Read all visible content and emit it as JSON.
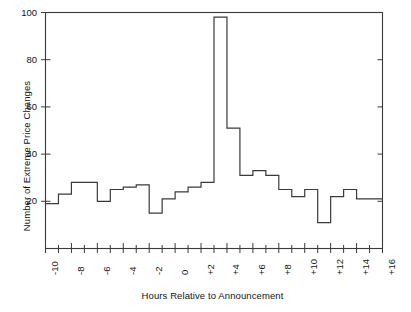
{
  "chart_data": {
    "type": "bar",
    "title": "",
    "xlabel": "Hours Relative to Announcement",
    "ylabel": "Number of Extreme Price Changes",
    "xlim": [
      -10,
      16
    ],
    "ylim": [
      0,
      100
    ],
    "grid": false,
    "legend": "none",
    "ytick_labels": [
      "100",
      "80",
      "60",
      "40",
      "20"
    ],
    "ytick_values": [
      100,
      80,
      60,
      40,
      20
    ],
    "xtick_labels": [
      "-10",
      "-8",
      "-6",
      "-4",
      "-2",
      "0",
      "+2",
      "+4",
      "+6",
      "+8",
      "+10",
      "+12",
      "+14",
      "+16"
    ],
    "xtick_values": [
      -10,
      -8,
      -6,
      -4,
      -2,
      0,
      2,
      4,
      6,
      8,
      10,
      12,
      14,
      16
    ],
    "minor_tick_interval": 1,
    "bin_width_hours": 1,
    "categories": [
      -10,
      -9,
      -8,
      -7,
      -6,
      -5,
      -4,
      -3,
      -2,
      -1,
      0,
      1,
      2,
      3,
      4,
      5,
      6,
      7,
      8,
      9,
      10,
      11,
      12,
      13,
      14,
      15
    ],
    "values": [
      19,
      23,
      28,
      28,
      20,
      25,
      26,
      27,
      15,
      15,
      21,
      21,
      24,
      26,
      28,
      28,
      98,
      51,
      31,
      31,
      33,
      33,
      25,
      22,
      21,
      25
    ],
    "series": [
      {
        "name": "Extreme price changes per hour",
        "points": [
          {
            "hour": -10,
            "count": 19
          },
          {
            "hour": -9,
            "count": 23
          },
          {
            "hour": -8,
            "count": 28
          },
          {
            "hour": -7,
            "count": 28
          },
          {
            "hour": -6,
            "count": 20
          },
          {
            "hour": -5,
            "count": 25
          },
          {
            "hour": -4,
            "count": 26
          },
          {
            "hour": -3,
            "count": 27
          },
          {
            "hour": -2,
            "count": 15
          },
          {
            "hour": -1,
            "count": 21
          },
          {
            "hour": 0,
            "count": 24
          },
          {
            "hour": 1,
            "count": 26
          },
          {
            "hour": 2,
            "count": 28
          },
          {
            "hour": 3,
            "count": 98
          },
          {
            "hour": 4,
            "count": 51
          },
          {
            "hour": 5,
            "count": 31
          },
          {
            "hour": 6,
            "count": 33
          },
          {
            "hour": 7,
            "count": 31
          },
          {
            "hour": 8,
            "count": 33
          },
          {
            "hour": 9,
            "count": 25
          },
          {
            "hour": 10,
            "count": 22
          },
          {
            "hour": 11,
            "count": 21
          },
          {
            "hour": 12,
            "count": 25
          },
          {
            "hour": 13,
            "count": 28
          },
          {
            "hour": 14,
            "count": 25
          },
          {
            "hour": 15,
            "count": 21
          }
        ]
      }
    ],
    "step_profile": [
      {
        "from": -10,
        "to": -9,
        "value": 19
      },
      {
        "from": -9,
        "to": -8,
        "value": 23
      },
      {
        "from": -8,
        "to": -6,
        "value": 28
      },
      {
        "from": -6,
        "to": -5,
        "value": 20
      },
      {
        "from": -5,
        "to": -4,
        "value": 25
      },
      {
        "from": -4,
        "to": -3,
        "value": 26
      },
      {
        "from": -3,
        "to": -2,
        "value": 27
      },
      {
        "from": -2,
        "to": -1,
        "value": 15
      },
      {
        "from": -1,
        "to": 0,
        "value": 21
      },
      {
        "from": 0,
        "to": 1,
        "value": 24
      },
      {
        "from": 1,
        "to": 2,
        "value": 26
      },
      {
        "from": 2,
        "to": 3,
        "value": 28
      },
      {
        "from": 3,
        "to": 4,
        "value": 98
      },
      {
        "from": 4,
        "to": 5,
        "value": 51
      },
      {
        "from": 5,
        "to": 6,
        "value": 31
      },
      {
        "from": 6,
        "to": 7,
        "value": 33
      },
      {
        "from": 7,
        "to": 8,
        "value": 31
      },
      {
        "from": 8,
        "to": 9,
        "value": 25
      },
      {
        "from": 9,
        "to": 10,
        "value": 22
      },
      {
        "from": 10,
        "to": 11,
        "value": 25
      },
      {
        "from": 11,
        "to": 12,
        "value": 11
      },
      {
        "from": 12,
        "to": 13,
        "value": 22
      },
      {
        "from": 13,
        "to": 14,
        "value": 25
      },
      {
        "from": 14,
        "to": 16,
        "value": 21
      }
    ],
    "colors": {
      "line": "#3a3a3a",
      "axis": "#3a3a3a",
      "background": "#ffffff",
      "text": "#141414"
    }
  }
}
